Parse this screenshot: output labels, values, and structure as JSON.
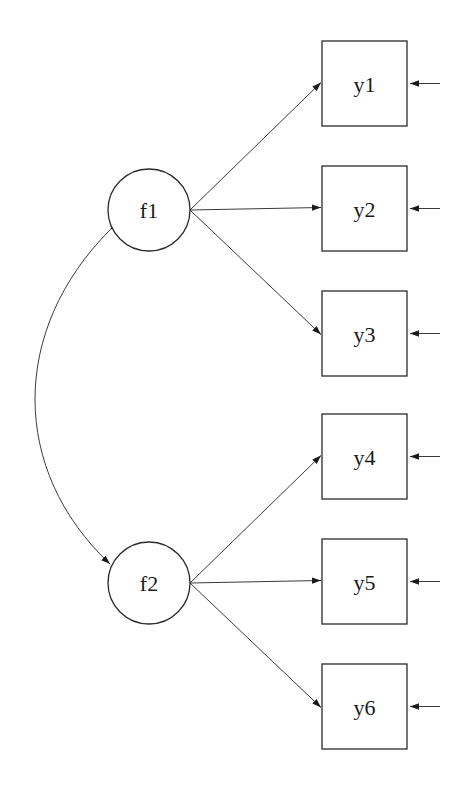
{
  "diagram": {
    "type": "path-diagram",
    "colors": {
      "line": "#3a3a3a",
      "text": "#1a1a1a",
      "background": "#ffffff"
    },
    "factors": [
      {
        "id": "f1",
        "label": "f1",
        "cx": 149,
        "cy": 210,
        "r": 41
      },
      {
        "id": "f2",
        "label": "f2",
        "cx": 149,
        "cy": 583,
        "r": 41
      }
    ],
    "indicators": [
      {
        "id": "y1",
        "label": "y1",
        "x": 322,
        "y": 41,
        "factor": "f1"
      },
      {
        "id": "y2",
        "label": "y2",
        "x": 322,
        "y": 166,
        "factor": "f1"
      },
      {
        "id": "y3",
        "label": "y3",
        "x": 322,
        "y": 291,
        "factor": "f1"
      },
      {
        "id": "y4",
        "label": "y4",
        "x": 322,
        "y": 414,
        "factor": "f2"
      },
      {
        "id": "y5",
        "label": "y5",
        "x": 322,
        "y": 539,
        "factor": "f2"
      },
      {
        "id": "y6",
        "label": "y6",
        "x": 322,
        "y": 664,
        "factor": "f2"
      }
    ],
    "box_size": 85,
    "covariances": [
      {
        "from": "f1",
        "to": "f2",
        "label": ""
      }
    ],
    "residuals": [
      "y1",
      "y2",
      "y3",
      "y4",
      "y5",
      "y6"
    ]
  }
}
